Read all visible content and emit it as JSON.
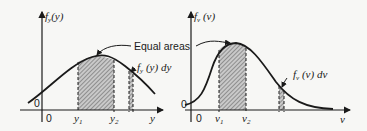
{
  "figure": {
    "annotation": "Equal areas",
    "left_panel": {
      "y_axis_label": "f_y(y)",
      "y_axis_func": "f",
      "y_axis_sub": "y",
      "y_axis_arg": "(y)",
      "x_axis_label": "y",
      "origin_x_label": "0",
      "origin_y_label": "0",
      "tick_1_main": "y",
      "tick_1_sub": "1",
      "tick_2_main": "y",
      "tick_2_sub": "2",
      "strip_label_func": "f",
      "strip_label_sub": "y",
      "strip_label_rest": "(y) dy"
    },
    "right_panel": {
      "y_axis_func": "f",
      "y_axis_sub": "v",
      "y_axis_arg": "(v)",
      "x_axis_label": "v",
      "origin_x_label": "0",
      "origin_y_label": "0",
      "tick_1_main": "v",
      "tick_1_sub": "1",
      "tick_2_main": "v",
      "tick_2_sub": "2",
      "strip_label_func": "f",
      "strip_label_sub": "v",
      "strip_label_rest": "(v) dv"
    },
    "colors": {
      "ink": "#1a1a1a",
      "hatch": "#8a8a8a",
      "background": "#f7f7f5"
    }
  }
}
